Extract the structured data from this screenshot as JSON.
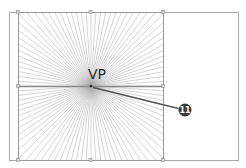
{
  "diagram": {
    "type": "one-point-perspective-grid",
    "outer_frame": {
      "x": 9,
      "y": 12,
      "w": 229,
      "h": 148,
      "stroke": "#a8a8a8"
    },
    "grid_square": {
      "x": 18,
      "y": 12,
      "w": 145,
      "h": 148,
      "stroke": "#9a9a9a"
    },
    "horizon_line": {
      "y": 86,
      "x1": 18,
      "x2": 163,
      "stroke": "#8a8a8a"
    },
    "vanishing_point": {
      "x": 91,
      "y": 86,
      "label": "VP"
    },
    "ray_color": "#b8b8b8",
    "ray_count": 96,
    "callout": {
      "number": "11",
      "circle_x": 185,
      "circle_y": 110,
      "radius": 6.5,
      "color": "#3a3a3a"
    }
  }
}
